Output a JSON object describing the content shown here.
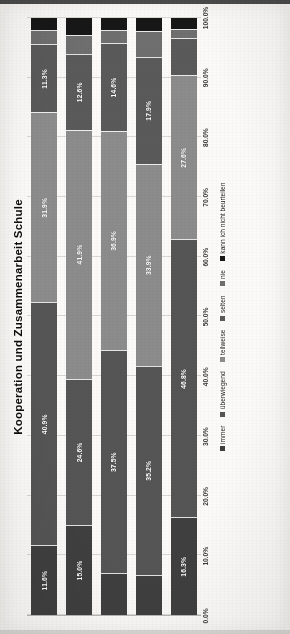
{
  "chart_data": {
    "type": "bar",
    "orientation": "horizontal-stacked",
    "title": "Kooperation und Zusammenarbeit Schule",
    "xlabel": "",
    "ylabel": "",
    "xlim": [
      0,
      100
    ],
    "grid": true,
    "legend_position": "bottom",
    "stacked": true,
    "stack_total_percent": 100,
    "axis_ticks": [
      "0.0%",
      "10.0%",
      "20.0%",
      "30.0%",
      "40.0%",
      "50.0%",
      "60.0%",
      "70.0%",
      "80.0%",
      "90.0%",
      "100.0%"
    ],
    "axis_tick_values": [
      0,
      10,
      20,
      30,
      40,
      50,
      60,
      70,
      80,
      90,
      100
    ],
    "categories": [
      "KP Schule1: Wenn es in der Schule Schwierigkeiten gab, wurden diese Probleme rasch gelöst",
      "KP Schule2: In der Schule funktionierte die Kommunikation unter den Lehrern reibungslos",
      "KP Schule3: In unserer Klassengemeinschaft \"zogen alle an einem Strang\"",
      "KP Schule4: In der Klasse wurde offen über Probleme bei der Zusammenarbeit gesprochen, und nach Lösungen gesucht",
      "KP Schule5: Bei Gruppenarbeiten arbeiteten wir konstruktiv und produktiv zusammen"
    ],
    "series": [
      {
        "name": "immer",
        "color": "#3f3f3f",
        "values": [
          11.6,
          15.0,
          6.9,
          6.6,
          16.3
        ]
      },
      {
        "name": "überwiegend",
        "color": "#555555",
        "values": [
          40.9,
          24.6,
          37.5,
          35.2,
          46.8
        ]
      },
      {
        "name": "teilweise",
        "color": "#8c8c8c",
        "values": [
          31.9,
          41.9,
          36.9,
          33.9,
          27.6
        ]
      },
      {
        "name": "selten",
        "color": "#5a5a5a",
        "values": [
          11.3,
          12.6,
          14.6,
          17.9,
          6.1
        ]
      },
      {
        "name": "nie",
        "color": "#6f6f6f",
        "values": [
          2.2,
          3.0,
          2.0,
          4.2,
          1.3
        ]
      },
      {
        "name": "kann ich nicht beurteilen",
        "color": "#171717",
        "values": [
          2.1,
          2.9,
          2.1,
          2.2,
          1.9
        ]
      }
    ],
    "bars": [
      {
        "category_key": "KP Schule1",
        "segments": [
          {
            "series": "immer",
            "value": 11.6,
            "label": "11.6%",
            "color": "#3f3f3f",
            "show_label": true
          },
          {
            "series": "überwiegend",
            "value": 40.9,
            "label": "40.9%",
            "color": "#555555",
            "show_label": true
          },
          {
            "series": "teilweise",
            "value": 31.9,
            "label": "31.9%",
            "color": "#8c8c8c",
            "show_label": true
          },
          {
            "series": "selten",
            "value": 11.3,
            "label": "11.3%",
            "color": "#5a5a5a",
            "show_label": true
          },
          {
            "series": "nie",
            "value": 2.2,
            "label": "",
            "color": "#6f6f6f",
            "show_label": false
          },
          {
            "series": "kann ich nicht beurteilen",
            "value": 2.1,
            "label": "",
            "color": "#171717",
            "show_label": false
          }
        ]
      },
      {
        "category_key": "KP Schule2",
        "segments": [
          {
            "series": "immer",
            "value": 15.0,
            "label": "15.0%",
            "color": "#3f3f3f",
            "show_label": true
          },
          {
            "series": "überwiegend",
            "value": 24.6,
            "label": "24.6%",
            "color": "#555555",
            "show_label": true
          },
          {
            "series": "teilweise",
            "value": 41.9,
            "label": "41.9%",
            "color": "#8c8c8c",
            "show_label": true
          },
          {
            "series": "selten",
            "value": 12.6,
            "label": "12.6%",
            "color": "#5a5a5a",
            "show_label": true
          },
          {
            "series": "nie",
            "value": 3.0,
            "label": "",
            "color": "#6f6f6f",
            "show_label": false
          },
          {
            "series": "kann ich nicht beurteilen",
            "value": 2.9,
            "label": "",
            "color": "#171717",
            "show_label": false
          }
        ]
      },
      {
        "category_key": "KP Schule3",
        "segments": [
          {
            "series": "immer",
            "value": 6.9,
            "label": "",
            "color": "#3f3f3f",
            "show_label": false
          },
          {
            "series": "überwiegend",
            "value": 37.5,
            "label": "37.5%",
            "color": "#555555",
            "show_label": true
          },
          {
            "series": "teilweise",
            "value": 36.9,
            "label": "36.9%",
            "color": "#8c8c8c",
            "show_label": true
          },
          {
            "series": "selten",
            "value": 14.6,
            "label": "14.6%",
            "color": "#5a5a5a",
            "show_label": true
          },
          {
            "series": "nie",
            "value": 2.0,
            "label": "",
            "color": "#6f6f6f",
            "show_label": false
          },
          {
            "series": "kann ich nicht beurteilen",
            "value": 2.1,
            "label": "",
            "color": "#171717",
            "show_label": false
          }
        ]
      },
      {
        "category_key": "KP Schule4",
        "segments": [
          {
            "series": "immer",
            "value": 6.6,
            "label": "",
            "color": "#3f3f3f",
            "show_label": false
          },
          {
            "series": "überwiegend",
            "value": 35.2,
            "label": "35.2%",
            "color": "#555555",
            "show_label": true
          },
          {
            "series": "teilweise",
            "value": 33.9,
            "label": "33.9%",
            "color": "#8c8c8c",
            "show_label": true
          },
          {
            "series": "selten",
            "value": 17.9,
            "label": "17.9%",
            "color": "#5a5a5a",
            "show_label": true
          },
          {
            "series": "nie",
            "value": 4.2,
            "label": "",
            "color": "#6f6f6f",
            "show_label": false
          },
          {
            "series": "kann ich nicht beurteilen",
            "value": 2.2,
            "label": "",
            "color": "#171717",
            "show_label": false
          }
        ]
      },
      {
        "category_key": "KP Schule5",
        "segments": [
          {
            "series": "immer",
            "value": 16.3,
            "label": "16.3%",
            "color": "#3f3f3f",
            "show_label": true
          },
          {
            "series": "überwiegend",
            "value": 46.8,
            "label": "46.8%",
            "color": "#555555",
            "show_label": true
          },
          {
            "series": "teilweise",
            "value": 27.6,
            "label": "27.6%",
            "color": "#8c8c8c",
            "show_label": true
          },
          {
            "series": "selten",
            "value": 6.1,
            "label": "",
            "color": "#5a5a5a",
            "show_label": false
          },
          {
            "series": "nie",
            "value": 1.3,
            "label": "",
            "color": "#6f6f6f",
            "show_label": false
          },
          {
            "series": "kann ich nicht beurteilen",
            "value": 1.9,
            "label": "",
            "color": "#171717",
            "show_label": false
          }
        ]
      }
    ]
  }
}
